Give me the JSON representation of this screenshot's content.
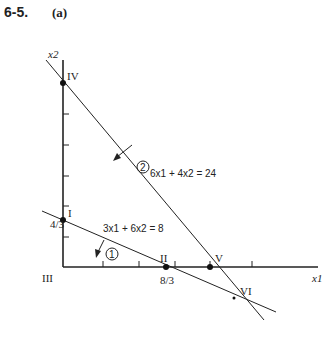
{
  "header": {
    "problem": "6-5.",
    "part": "(a)"
  },
  "axes": {
    "x_label": "x1",
    "y_label": "x2"
  },
  "constraints": [
    {
      "id": "1",
      "equation": "3x1 + 6x2 = 8"
    },
    {
      "id": "2",
      "equation": "6x1 + 4x2 = 24"
    }
  ],
  "points": [
    {
      "label": "I",
      "x1": "0",
      "x2": "4/3"
    },
    {
      "label": "II",
      "x1": "8/3",
      "x2": "0"
    },
    {
      "label": "III",
      "x1": "0",
      "x2": "0"
    },
    {
      "label": "IV",
      "x1": "0",
      "x2": "6"
    },
    {
      "label": "V",
      "x1": "4",
      "x2": "0"
    },
    {
      "label": "VI",
      "x1": "14/3",
      "x2": "-1"
    }
  ],
  "tick_labels": {
    "x2_frac": "4/3",
    "x1_frac": "8/3"
  }
}
